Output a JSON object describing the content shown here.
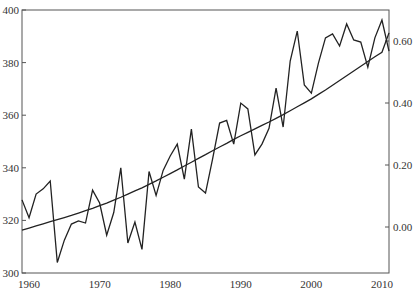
{
  "chart_data": {
    "type": "line",
    "title": "",
    "xlabel": "",
    "ylabel": "",
    "ylabel_right": "",
    "xlim": [
      1959,
      2011
    ],
    "ylim": [
      300,
      400
    ],
    "ylim_right": [
      -0.14,
      0.7
    ],
    "grid": false,
    "legend": null,
    "x_ticks": [
      1960,
      1970,
      1980,
      1990,
      2000,
      2010
    ],
    "x_tick_labels": [
      "1960",
      "1970",
      "1980",
      "1990",
      "2000",
      "2010"
    ],
    "y_ticks_left": [
      300,
      320,
      340,
      360,
      380,
      400
    ],
    "y_tick_labels_left": [
      "300",
      "320",
      "340",
      "360",
      "380",
      "400"
    ],
    "y_ticks_right": [
      0.0,
      0.2,
      0.4,
      0.6
    ],
    "y_tick_labels_right": [
      "0.00",
      "0.20",
      "0.40",
      "0.60"
    ],
    "x": [
      1959,
      1960,
      1961,
      1962,
      1963,
      1964,
      1965,
      1966,
      1967,
      1968,
      1969,
      1970,
      1971,
      1972,
      1973,
      1974,
      1975,
      1976,
      1977,
      1978,
      1979,
      1980,
      1981,
      1982,
      1983,
      1984,
      1985,
      1986,
      1987,
      1988,
      1989,
      1990,
      1991,
      1992,
      1993,
      1994,
      1995,
      1996,
      1997,
      1998,
      1999,
      2000,
      2001,
      2002,
      2003,
      2004,
      2005,
      2006,
      2007,
      2008,
      2009,
      2010,
      2011
    ],
    "series": [
      {
        "name": "fluctuating series (right axis)",
        "axis": "right",
        "values_left_scale": [
          327.8,
          321,
          330,
          332,
          335,
          304,
          312.5,
          318.6,
          319.8,
          319,
          331.5,
          326.6,
          314.4,
          323,
          340,
          311.4,
          319.4,
          309,
          338.6,
          329.5,
          339,
          344.5,
          349,
          335.7,
          354.7,
          332.7,
          330.4,
          343.3,
          357,
          358,
          349,
          364.6,
          362.4,
          344.9,
          349,
          355,
          370.3,
          355.5,
          380.6,
          392,
          371.5,
          368.4,
          379.8,
          389.4,
          390.9,
          386.3,
          394.7,
          388.6,
          387.8,
          378.3,
          389.4,
          396.2,
          384.4
        ]
      },
      {
        "name": "smooth rising series (left axis)",
        "axis": "left",
        "values": [
          316.3,
          317.1,
          317.9,
          318.7,
          319.5,
          320.3,
          321.1,
          321.9,
          322.8,
          323.7,
          324.6,
          325.6,
          326.6,
          327.7,
          328.8,
          330,
          331.2,
          332.4,
          333.7,
          335,
          336.4,
          337.8,
          339.2,
          340.7,
          342.1,
          343.6,
          345,
          346.5,
          347.9,
          349.3,
          350.8,
          352.2,
          353.5,
          354.8,
          356.1,
          357.4,
          358.8,
          360.2,
          361.7,
          363.2,
          364.7,
          366.2,
          367.9,
          369.6,
          371.4,
          373.2,
          375,
          376.8,
          378.6,
          380.4,
          382.2,
          383.9,
          391.3
        ]
      }
    ]
  }
}
